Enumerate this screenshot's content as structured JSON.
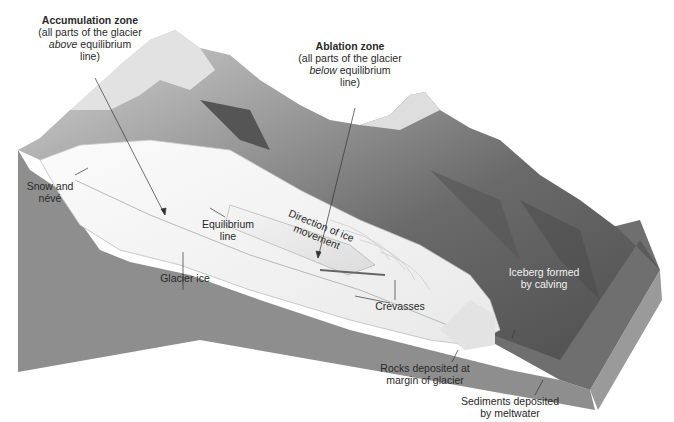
{
  "diagram": {
    "labels": {
      "accumulation_zone": {
        "heading": "Accumulation zone",
        "line1": "(all parts of the glacier",
        "line2_italic": "above",
        "line2_rest": " equilibrium",
        "line3": "line)"
      },
      "ablation_zone": {
        "heading": "Ablation zone",
        "line1": "(all parts of the glacier",
        "line2_italic": "below",
        "line2_rest": " equilibrium",
        "line3": "line)"
      },
      "snow_neve": {
        "line1": "Snow and",
        "line2": "névé"
      },
      "equilibrium_line": {
        "line1": "Equilibrium",
        "line2": "line"
      },
      "glacier_ice": {
        "line1": "Glacier ice"
      },
      "direction": {
        "line1": "Direction of ice",
        "line2": "movement"
      },
      "crevasses": {
        "line1": "Crevasses"
      },
      "iceberg": {
        "line1": "Iceberg formed",
        "line2": "by calving"
      },
      "rocks": {
        "line1": "Rocks deposited at",
        "line2": "margin of glacier"
      },
      "sediments": {
        "line1": "Sediments deposited",
        "line2": "by meltwater"
      }
    },
    "colors": {
      "ground": "#8c8c8c",
      "ground_dark": "#7a7a7a",
      "ice": "#f4f4f4",
      "mountain": "#6e6e6e",
      "background": "#ffffff"
    }
  }
}
